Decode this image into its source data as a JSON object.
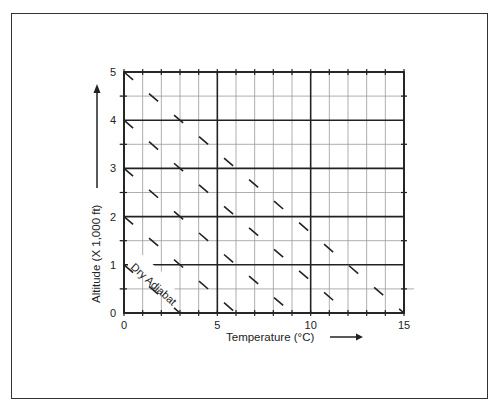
{
  "chart_data": {
    "type": "line",
    "title": "",
    "xlabel": "Temperature (°C)",
    "ylabel": "Altitude (X 1,000 ft)",
    "xlim": [
      0,
      15
    ],
    "ylim": [
      0,
      5
    ],
    "x_ticks": [
      "0",
      "5",
      "10",
      "15"
    ],
    "y_ticks": [
      "0",
      "1",
      "2",
      "3",
      "4",
      "5"
    ],
    "grid": {
      "x_minor_step": 1,
      "x_major_step": 5,
      "y_minor_step": 0.5,
      "y_major_step": 1
    },
    "annotation": "Dry Adiabat",
    "series": [
      {
        "name": "Dry Adiabat 1",
        "style": "dashed",
        "points": [
          [
            0,
            5
          ],
          [
            15,
            0
          ]
        ]
      },
      {
        "name": "Dry Adiabat 2",
        "style": "dashed",
        "points": [
          [
            0,
            4
          ],
          [
            12,
            0
          ]
        ]
      },
      {
        "name": "Dry Adiabat 3",
        "style": "dashed",
        "points": [
          [
            0,
            3
          ],
          [
            9,
            0
          ]
        ]
      },
      {
        "name": "Dry Adiabat 4",
        "style": "dashed",
        "points": [
          [
            0,
            2
          ],
          [
            6,
            0
          ]
        ]
      },
      {
        "name": "Dry Adiabat 5",
        "style": "dashed",
        "points": [
          [
            0,
            1
          ],
          [
            3,
            0
          ]
        ]
      }
    ]
  },
  "labels": {
    "x_axis": "Temperature (°C)",
    "y_axis": "Altitude (X 1,000 ft)",
    "annotation": "Dry Adiabat"
  },
  "colors": {
    "line": "#222222",
    "grid_minor": "#9a9a9a",
    "grid_major": "#222222"
  }
}
